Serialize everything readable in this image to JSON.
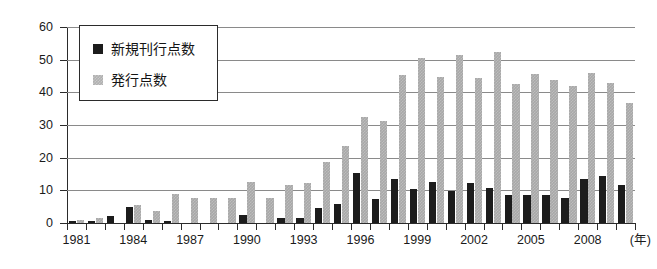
{
  "chart_data": {
    "type": "bar",
    "title": "",
    "xlabel": "(年)",
    "ylabel": "",
    "ylim": [
      0,
      60
    ],
    "ytick_step": 10,
    "yticks": [
      0,
      10,
      20,
      30,
      40,
      50,
      60
    ],
    "grid": true,
    "legend_position": "top-left",
    "categories": [
      "1981",
      "1982",
      "1983",
      "1984",
      "1985",
      "1986",
      "1987",
      "1988",
      "1989",
      "1990",
      "1991",
      "1992",
      "1993",
      "1994",
      "1995",
      "1996",
      "1997",
      "1998",
      "1999",
      "2000",
      "2001",
      "2002",
      "2003",
      "2004",
      "2005",
      "2006",
      "2007",
      "2008",
      "2009",
      "2010"
    ],
    "xtick_labels": [
      "1981",
      "1984",
      "1987",
      "1990",
      "1993",
      "1996",
      "1999",
      "2002",
      "2005",
      "2008"
    ],
    "series": [
      {
        "name": "新規刊行点数",
        "color": "#1c1c1c",
        "values": [
          0.7,
          0.6,
          2.0,
          4.8,
          0.9,
          0.7,
          0,
          0,
          0,
          2.6,
          0,
          1.5,
          1.5,
          4.7,
          5.7,
          15.2,
          7.5,
          13.5,
          10.5,
          12.6,
          9.7,
          12.4,
          10.8,
          8.7,
          8.7,
          8.7,
          7.8,
          13.6,
          14.5,
          11.7
        ]
      },
      {
        "name": "発行点数",
        "color": "#b0b0b0",
        "values": [
          0.8,
          1.5,
          0,
          5.6,
          3.8,
          8.8,
          7.8,
          7.8,
          7.8,
          12.7,
          7.8,
          11.5,
          12.4,
          18.6,
          23.6,
          32.5,
          31.3,
          45.3,
          50.6,
          44.7,
          51.3,
          44.5,
          52.5,
          42.6,
          45.7,
          43.8,
          41.9,
          46.0,
          42.8,
          36.8
        ]
      }
    ]
  },
  "legend": {
    "items": [
      {
        "label": "新規刊行点数",
        "swatch": "black-square"
      },
      {
        "label": "発行点数",
        "swatch": "gray-square"
      }
    ]
  },
  "axes": {
    "y_labels": [
      "60",
      "50",
      "40",
      "30",
      "20",
      "10",
      "0"
    ],
    "x_unit": "(年)"
  }
}
